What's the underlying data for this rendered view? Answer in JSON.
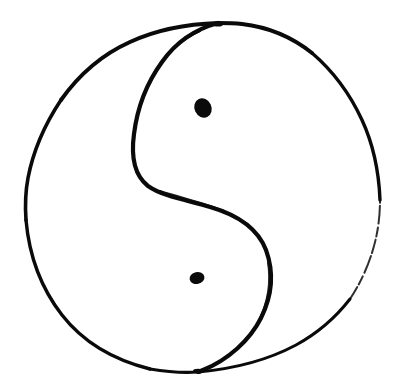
{
  "canvas": {
    "width": 398,
    "height": 391,
    "background_color": "#ffffff",
    "ink_color": "#0a0a0a",
    "title": "Yin Yang Symbol"
  },
  "drawing": {
    "name": "yin-yang-taijitu",
    "style": "hand-drawn ink sketch",
    "stroke_color": "#0a0a0a",
    "stroke_width_main": 3.6,
    "stroke_width_thin": 1.6,
    "outer_circle": {
      "name": "outer-circle",
      "center_x": 200,
      "center_y": 198,
      "radius": 176,
      "left_extent_x": 25,
      "right_extent_x": 378,
      "top_extent_y": 22,
      "bottom_extent_y": 375,
      "path": "M 218 23 C 160 25 110 48 75 92 C 42 133 25 175 25 202 C 25 244 38 288 64 320 C 96 358 148 374 197 372 C 245 370 295 356 328 326 C 362 295 378 248 378 198 C 378 150 362 104 330 70 C 299 38 262 23 218 23 Z"
    },
    "s_curve": {
      "name": "s-divider-curve",
      "top_junction_x": 218,
      "top_junction_y": 23,
      "bottom_junction_x": 197,
      "bottom_junction_y": 372,
      "left_bulge_x": 131,
      "left_bulge_y": 150,
      "right_bulge_x": 273,
      "right_bulge_y": 275,
      "inflection_x": 196,
      "inflection_y": 200,
      "path": "M 218 23 C 186 32 160 52 146 82 C 133 110 130 134 131 152 C 132 170 140 184 156 190 C 178 198 214 204 240 216 C 262 227 272 246 273 272 C 274 300 262 328 240 348 C 222 364 206 370 197 372"
    },
    "upper_dot": {
      "name": "upper-eye-dot",
      "center_x": 203,
      "center_y": 108,
      "radius_x": 8.5,
      "radius_y": 10,
      "rotation_deg": -25,
      "fill": "#0a0a0a"
    },
    "lower_dot": {
      "name": "lower-eye-dot",
      "center_x": 197,
      "center_y": 278,
      "radius_x": 7.5,
      "radius_y": 6,
      "rotation_deg": -12,
      "fill": "#0a0a0a"
    },
    "top_junction_blob": {
      "name": "top-junction-blob",
      "center_x": 218,
      "center_y": 24,
      "radius_x": 5,
      "radius_y": 2.6
    },
    "bottom_junction_blob": {
      "name": "bottom-junction-blob",
      "center_x": 198,
      "center_y": 371,
      "radius_x": 5,
      "radius_y": 2.2
    },
    "faded_arc_segment": {
      "name": "faded-lower-right-arc",
      "start_y": 240,
      "end_y": 300,
      "note": "stroke thins and breaks along lower right arc"
    }
  }
}
